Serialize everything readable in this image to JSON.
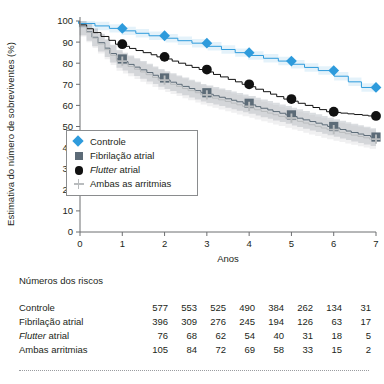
{
  "chart_data": {
    "type": "line",
    "title": "",
    "subtitle": "",
    "xlabel": "Anos",
    "ylabel": "Estimativa do número de sobreviventes (%)",
    "xlim": [
      0,
      7
    ],
    "ylim": [
      0,
      100
    ],
    "xticks": [
      0,
      1,
      2,
      3,
      4,
      5,
      6,
      7
    ],
    "yticks": [
      0,
      10,
      20,
      30,
      40,
      50,
      60,
      70,
      80,
      90,
      100
    ],
    "grid": false,
    "legend_position": "center-left-inside",
    "step_style": "kaplan-meier",
    "x": [
      0,
      1,
      2,
      3,
      4,
      5,
      6,
      7
    ],
    "series": [
      {
        "name": "Controle",
        "marker": "diamond",
        "color": "#2e9bdc",
        "values": [
          100,
          96.5,
          93,
          89.5,
          85,
          81,
          76.5,
          68.5
        ]
      },
      {
        "name": "Fibrilação atrial",
        "marker": "square",
        "color": "#5c6b77",
        "values": [
          100,
          82,
          73,
          66,
          61,
          55.5,
          50,
          45
        ]
      },
      {
        "name": "Flutter atrial",
        "marker": "circle",
        "color": "#111111",
        "italic_first_word": true,
        "values": [
          100,
          89,
          83,
          77,
          70,
          63,
          57,
          55
        ]
      },
      {
        "name": "Ambas as arritmias",
        "marker": "plus",
        "color": "#b9bcbe",
        "values": [
          100,
          81,
          72,
          65,
          59.5,
          54,
          48.5,
          44
        ]
      }
    ]
  },
  "legend": {
    "items": [
      {
        "label": "Controle",
        "marker": "diamond"
      },
      {
        "label": "Fibrilação atrial",
        "marker": "square"
      },
      {
        "label_italic": "Flutter",
        "label_rest": " atrial",
        "marker": "circle"
      },
      {
        "label": "Ambas as arritmias",
        "marker": "plus"
      }
    ]
  },
  "risk_table": {
    "title": "Números dos riscos",
    "columns": [
      "0",
      "1",
      "2",
      "3",
      "4",
      "5",
      "6",
      "7"
    ],
    "rows": [
      {
        "label": "Controle",
        "italic_prefix": "",
        "values": [
          "577",
          "553",
          "525",
          "490",
          "384",
          "262",
          "134",
          "31"
        ]
      },
      {
        "label": "Fibrilação atrial",
        "italic_prefix": "",
        "values": [
          "396",
          "309",
          "276",
          "245",
          "194",
          "126",
          "63",
          "17"
        ]
      },
      {
        "label": " atrial",
        "italic_prefix": "Flutter",
        "values": [
          "76",
          "68",
          "62",
          "54",
          "40",
          "31",
          "18",
          "5"
        ]
      },
      {
        "label": "Ambas arritmias",
        "italic_prefix": "",
        "values": [
          "105",
          "84",
          "72",
          "69",
          "58",
          "33",
          "15",
          "2"
        ]
      }
    ]
  },
  "colors": {
    "controle": "#2e9bdc",
    "fibrilacao": "#5c6b77",
    "flutter": "#111111",
    "ambas": "#b9bcbe",
    "axis": "#6d6e71",
    "text": "#231f20"
  }
}
